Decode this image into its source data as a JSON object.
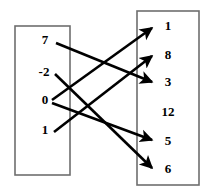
{
  "figure": {
    "background_color": "#ffffff",
    "box_stroke_color": "#6e6e6e",
    "arrow_color": "#000000",
    "label_color": "#000000"
  },
  "domain_set": {
    "name": "left-set",
    "box": {
      "x": 15,
      "y": 26,
      "width": 55,
      "height": 149
    },
    "elements": [
      {
        "label": "7",
        "x": 45,
        "y": 41
      },
      {
        "label": "-2",
        "x": 44,
        "y": 73
      },
      {
        "label": "0",
        "x": 45,
        "y": 101
      },
      {
        "label": "1",
        "x": 45,
        "y": 131
      }
    ]
  },
  "range_set": {
    "name": "right-set",
    "box": {
      "x": 137,
      "y": 11,
      "width": 62,
      "height": 174
    },
    "elements": [
      {
        "label": "1",
        "x": 168,
        "y": 27
      },
      {
        "label": "8",
        "x": 168,
        "y": 56
      },
      {
        "label": "3",
        "x": 168,
        "y": 83
      },
      {
        "label": "12",
        "x": 168,
        "y": 113
      },
      {
        "label": "5",
        "x": 168,
        "y": 142
      },
      {
        "label": "6",
        "x": 168,
        "y": 170
      }
    ]
  },
  "arrows": [
    {
      "name": "arrow-7-to-3",
      "from": "7",
      "to": "3",
      "x1": 56,
      "y1": 43,
      "x2": 152,
      "y2": 82
    },
    {
      "name": "arrow-neg2-to-6",
      "from": "-2",
      "to": "6",
      "x1": 55,
      "y1": 74,
      "x2": 152,
      "y2": 168
    },
    {
      "name": "arrow-0-to-1",
      "from": "0",
      "to": "1",
      "x1": 52,
      "y1": 100,
      "x2": 152,
      "y2": 28
    },
    {
      "name": "arrow-0-to-5",
      "from": "0",
      "to": "5",
      "x1": 52,
      "y1": 103,
      "x2": 152,
      "y2": 140
    },
    {
      "name": "arrow-1-to-8",
      "from": "1",
      "to": "8",
      "x1": 54,
      "y1": 132,
      "x2": 152,
      "y2": 56
    }
  ]
}
